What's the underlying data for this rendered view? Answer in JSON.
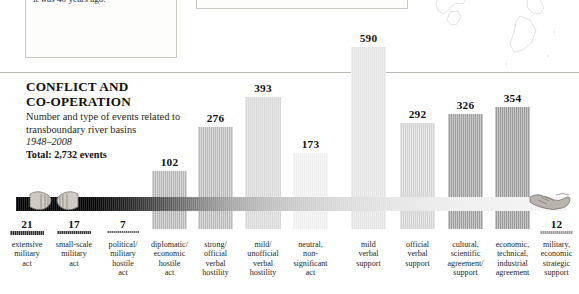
{
  "callout": {
    "text": "contributed to an environmental disaster, leaving it one-tenth the size it was 40 years ago."
  },
  "heading": {
    "title_line1": "CONFLICT AND",
    "title_line2": "CO-OPERATION",
    "subtitle_line1": "Number and type of events related to",
    "subtitle_line2": "transboundary river basins",
    "years": "1948–2008",
    "total": "Total: 2,732 events"
  },
  "icons": {
    "left": "fists-icon",
    "right": "handshake-icon",
    "map": "map-outline-icon"
  },
  "chart_data": {
    "type": "bar",
    "title": "CONFLICT AND CO-OPERATION",
    "subtitle": "Number and type of events related to transboundary river basins",
    "period": "1948–2008",
    "total": 2732,
    "xlabel": "",
    "ylabel": "Number of events",
    "ylim": [
      0,
      590
    ],
    "grid": false,
    "legend": "none",
    "categories": [
      "extensive military act",
      "small-scale military act",
      "political/ military hostile act",
      "diplomatic/ economic hostile act",
      "strong/ official verbal hostility",
      "mild/ unofficial verbal hostility",
      "neutral, non-significant act",
      "mild verbal support",
      "official verbal support",
      "cultural, scientific agreement/ support",
      "economic, technical, industrial agreement",
      "military, economic strategic support"
    ],
    "values": [
      21,
      17,
      7,
      102,
      276,
      393,
      173,
      590,
      292,
      326,
      354,
      12
    ]
  },
  "bars": [
    {
      "value": "21",
      "label_lines": [
        "extensive",
        "military",
        "act"
      ],
      "x": 10,
      "w": 34,
      "color": "#2e2e2e",
      "dir": "down",
      "h": 4
    },
    {
      "value": "17",
      "label_lines": [
        "small-scale",
        "military",
        "act"
      ],
      "x": 57,
      "w": 34,
      "color": "#3a3a3a",
      "dir": "down",
      "h": 3
    },
    {
      "value": "7",
      "label_lines": [
        "political/",
        "military",
        "hostile",
        "act"
      ],
      "x": 107,
      "w": 32,
      "color": "#6e6e6e",
      "dir": "down",
      "h": 2
    },
    {
      "value": "102",
      "label_lines": [
        "diplomatic/",
        "economic",
        "hostile",
        "act"
      ],
      "x": 152,
      "w": 35,
      "color": "#b4b4b4",
      "dir": "up",
      "h": 26
    },
    {
      "value": "276",
      "label_lines": [
        "strong/",
        "official",
        "verbal",
        "hostility"
      ],
      "x": 198,
      "w": 35,
      "color": "#b9b9b9",
      "dir": "up",
      "h": 70
    },
    {
      "value": "393",
      "label_lines": [
        "mild/",
        "unofficial",
        "verbal",
        "hostility"
      ],
      "x": 245,
      "w": 36,
      "color": "#d7d7d7",
      "dir": "up",
      "h": 100
    },
    {
      "value": "173",
      "label_lines": [
        "neutral,",
        "non-",
        "significant",
        "act"
      ],
      "x": 293,
      "w": 35,
      "color": "#efefef",
      "dir": "up",
      "h": 44
    },
    {
      "value": "590",
      "label_lines": [
        "mild",
        "verbal",
        "support"
      ],
      "x": 351,
      "w": 35,
      "color": "#e3e3e3",
      "dir": "up",
      "h": 150
    },
    {
      "value": "292",
      "label_lines": [
        "official",
        "verbal",
        "support"
      ],
      "x": 400,
      "w": 35,
      "color": "#d2d2d2",
      "dir": "up",
      "h": 74
    },
    {
      "value": "326",
      "label_lines": [
        "cultural,",
        "scientific",
        "agreement/",
        "support"
      ],
      "x": 448,
      "w": 35,
      "color": "#9e9e9e",
      "dir": "up",
      "h": 83
    },
    {
      "value": "354",
      "label_lines": [
        "economic,",
        "technical,",
        "industrial",
        "agreement"
      ],
      "x": 495,
      "w": 35,
      "color": "#9a9a9a",
      "dir": "up",
      "h": 90
    },
    {
      "value": "12",
      "label_lines": [
        "military,",
        "economic",
        "strategic",
        "support"
      ],
      "x": 540,
      "w": 33,
      "color": "#9c9c9c",
      "dir": "down",
      "h": 3
    }
  ]
}
